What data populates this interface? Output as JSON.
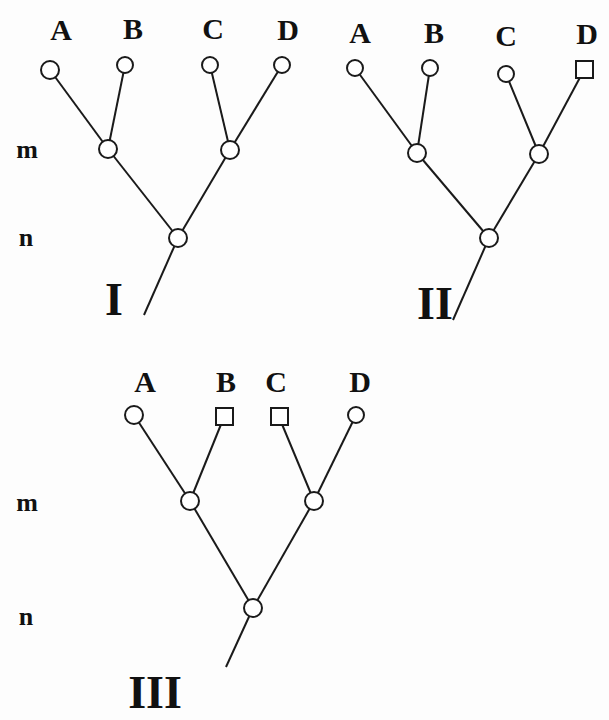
{
  "figure": {
    "level_labels": {
      "m": "m",
      "n": "n"
    },
    "trees": [
      {
        "id": "I",
        "label": "I",
        "leaves": [
          {
            "name": "A",
            "shape": "circle"
          },
          {
            "name": "B",
            "shape": "circle"
          },
          {
            "name": "C",
            "shape": "circle"
          },
          {
            "name": "D",
            "shape": "circle"
          }
        ],
        "structure": "((A,B)m,(C,D)m)n"
      },
      {
        "id": "II",
        "label": "II",
        "leaves": [
          {
            "name": "A",
            "shape": "circle"
          },
          {
            "name": "B",
            "shape": "circle"
          },
          {
            "name": "C",
            "shape": "circle"
          },
          {
            "name": "D",
            "shape": "square"
          }
        ],
        "structure": "((A,B)m,(C,D)m)n"
      },
      {
        "id": "III",
        "label": "III",
        "leaves": [
          {
            "name": "A",
            "shape": "circle"
          },
          {
            "name": "B",
            "shape": "square"
          },
          {
            "name": "C",
            "shape": "square"
          },
          {
            "name": "D",
            "shape": "circle"
          }
        ],
        "structure": "((A,B)m,(C,D)m)n"
      }
    ],
    "colors": {
      "line": "#1a1a1a",
      "node_fill": "#ffffff",
      "text": "#111111"
    }
  }
}
